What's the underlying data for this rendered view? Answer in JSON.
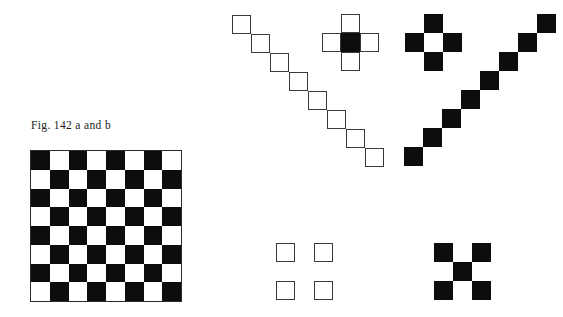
{
  "page": {
    "width": 563,
    "height": 317,
    "background_color": "#ffffff",
    "ink_color": "#0d0d0d",
    "outline_color": "#3a3a3a",
    "module_size": 19
  },
  "caption": {
    "text": "Fig. 142 a and b",
    "figure_number": "142",
    "parts": "a and b"
  },
  "checkerboard": {
    "label": "checkerboard",
    "left": 30,
    "top": 150,
    "size": 152,
    "rows": 8,
    "columns": 8,
    "cell_size": 18.75,
    "top_left_cell": "dark",
    "dark_color": "#0d0d0d",
    "light_color": "#ffffff",
    "border_color": "#2b2b2b"
  },
  "figures": [
    {
      "name": "white-diagonal-staircase",
      "description": "Eight outlined white squares joined corner to corner descending from upper left to lower right",
      "style": "fill-white-outline",
      "left": 232,
      "top": 15,
      "module": 19,
      "count": 8,
      "cells": [
        {
          "col": 0,
          "row": 0
        },
        {
          "col": 1,
          "row": 1
        },
        {
          "col": 2,
          "row": 2
        },
        {
          "col": 3,
          "row": 3
        },
        {
          "col": 4,
          "row": 4
        },
        {
          "col": 5,
          "row": 5
        },
        {
          "col": 6,
          "row": 6
        },
        {
          "col": 7,
          "row": 7
        }
      ]
    },
    {
      "name": "white-cross-black-center",
      "description": "Greek cross of five modules: four outlined white arms around a solid black center",
      "left": 322,
      "top": 14,
      "module": 19,
      "count": 5,
      "cells": [
        {
          "col": 1,
          "row": 0,
          "style": "fill-white-outline"
        },
        {
          "col": 0,
          "row": 1,
          "style": "fill-white-outline"
        },
        {
          "col": 1,
          "row": 1,
          "style": "fill-black"
        },
        {
          "col": 2,
          "row": 1,
          "style": "fill-white-outline"
        },
        {
          "col": 1,
          "row": 2,
          "style": "fill-white-outline"
        }
      ]
    },
    {
      "name": "black-cross-white-center",
      "description": "Greek cross of four solid black arms surrounding an empty white center",
      "left": 405,
      "top": 14,
      "module": 19,
      "count": 5,
      "cells": [
        {
          "col": 1,
          "row": 0,
          "style": "fill-black"
        },
        {
          "col": 0,
          "row": 1,
          "style": "fill-black"
        },
        {
          "col": 1,
          "row": 1,
          "style": "fill-white"
        },
        {
          "col": 2,
          "row": 1,
          "style": "fill-black"
        },
        {
          "col": 1,
          "row": 2,
          "style": "fill-black"
        }
      ]
    },
    {
      "name": "black-diagonal-staircase",
      "description": "Eight solid black squares joined corner to corner rising from lower left to upper right",
      "style": "fill-black",
      "left": 404,
      "top": 14,
      "module": 19,
      "count": 8,
      "cells": [
        {
          "col": 0,
          "row": 7
        },
        {
          "col": 1,
          "row": 6
        },
        {
          "col": 2,
          "row": 5
        },
        {
          "col": 3,
          "row": 4
        },
        {
          "col": 4,
          "row": 3
        },
        {
          "col": 5,
          "row": 2
        },
        {
          "col": 6,
          "row": 1
        },
        {
          "col": 7,
          "row": 0
        }
      ]
    },
    {
      "name": "white-saltire-open-center",
      "description": "Four outlined white squares at the corners of a three by three field, center and edges left empty",
      "style": "fill-white-outline",
      "left": 276,
      "top": 243,
      "module": 19,
      "count": 4,
      "cells": [
        {
          "col": 0,
          "row": 0
        },
        {
          "col": 2,
          "row": 0
        },
        {
          "col": 0,
          "row": 2
        },
        {
          "col": 2,
          "row": 2
        }
      ]
    },
    {
      "name": "black-saltire-filled-center",
      "description": "Five solid black squares forming a diagonal cross: four corners plus the center module",
      "style": "fill-black",
      "left": 434,
      "top": 243,
      "module": 19,
      "count": 5,
      "cells": [
        {
          "col": 0,
          "row": 0
        },
        {
          "col": 2,
          "row": 0
        },
        {
          "col": 1,
          "row": 1
        },
        {
          "col": 0,
          "row": 2
        },
        {
          "col": 2,
          "row": 2
        }
      ]
    }
  ]
}
